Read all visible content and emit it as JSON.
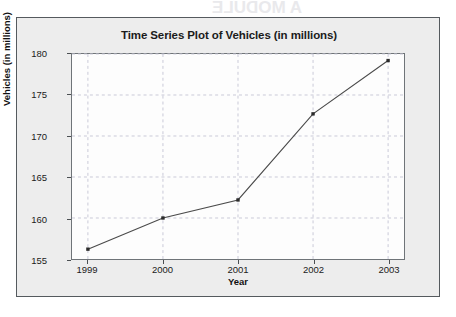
{
  "page": {
    "background_color": "#ffffff",
    "card_background_color": "#ededed",
    "card_border_color": "#555a5e"
  },
  "bleed_through": {
    "note": "faint mirrored text showing through scanned page",
    "top_line": "A MODULE",
    "lines": [
      "de for each Topic and 3 M heads",
      "4.  SRQ Study Guide Too Formats",
      "5.  Quadratic Course Card structure",
      "Charts Guide Primary Layout",
      "Use the new Request Order 7 8 2"
    ]
  },
  "chart_data": {
    "type": "line",
    "title": "Time Series Plot of Vehicles (in millions)",
    "xlabel": "Year",
    "ylabel": "Vehicles (in millions)",
    "categories": [
      "1999",
      "2000",
      "2001",
      "2002",
      "2003"
    ],
    "x": [
      1999,
      2000,
      2001,
      2002,
      2003
    ],
    "values": [
      156.2,
      160.0,
      162.2,
      172.7,
      179.2
    ],
    "series": [
      {
        "name": "Vehicles",
        "values": [
          156.2,
          160.0,
          162.2,
          172.7,
          179.2
        ]
      }
    ],
    "ylim": [
      155,
      180
    ],
    "y_ticks": [
      155,
      160,
      165,
      170,
      175,
      180
    ],
    "y_tick_labels": [
      "155",
      "160",
      "165",
      "170",
      "175",
      "180"
    ],
    "x_tick_labels": [
      "1999",
      "2000",
      "2001",
      "2002",
      "2003"
    ],
    "grid": true,
    "grid_style": "dashed",
    "grid_color": "#c9c9d8",
    "legend": false,
    "line_color": "#4a4a4a",
    "marker": "square",
    "marker_color": "#2b2b2b",
    "plot_background_color": "#fdfdfd",
    "axis_color": "#6f7478"
  }
}
